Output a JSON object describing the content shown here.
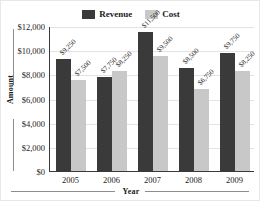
{
  "chart_data": {
    "type": "bar",
    "title": "",
    "subtitle": "",
    "xlabel": "Year",
    "ylabel": "Amount",
    "categories": [
      "2005",
      "2006",
      "2007",
      "2008",
      "2009"
    ],
    "series": [
      {
        "name": "Revenue",
        "color": "#3a3a3a",
        "values": [
          9250,
          7750,
          11500,
          8500,
          9750
        ],
        "labels": [
          "$9,250",
          "$7,750",
          "$11,500",
          "$8,500",
          "$9,750"
        ]
      },
      {
        "name": "Cost",
        "color": "#c8c8c8",
        "values": [
          7500,
          8250,
          9500,
          6750,
          8250
        ],
        "labels": [
          "$7,500",
          "$8,250",
          "$9,500",
          "$6,750",
          "$8,250"
        ]
      }
    ],
    "ylim": [
      0,
      12000
    ],
    "ytick_values": [
      0,
      2000,
      4000,
      6000,
      8000,
      10000,
      12000
    ],
    "ytick_labels": [
      "$0",
      "$2,000",
      "$4,000",
      "$6,000",
      "$8,000",
      "$10,000",
      "$12,000"
    ],
    "grid": true,
    "legend_position": "top-center",
    "data_labels": true,
    "data_label_rotation": -45
  },
  "legend": {
    "entries": [
      {
        "label": "Revenue"
      },
      {
        "label": "Cost"
      }
    ]
  },
  "axes": {
    "y_title": "Amount",
    "x_title": "Year"
  }
}
